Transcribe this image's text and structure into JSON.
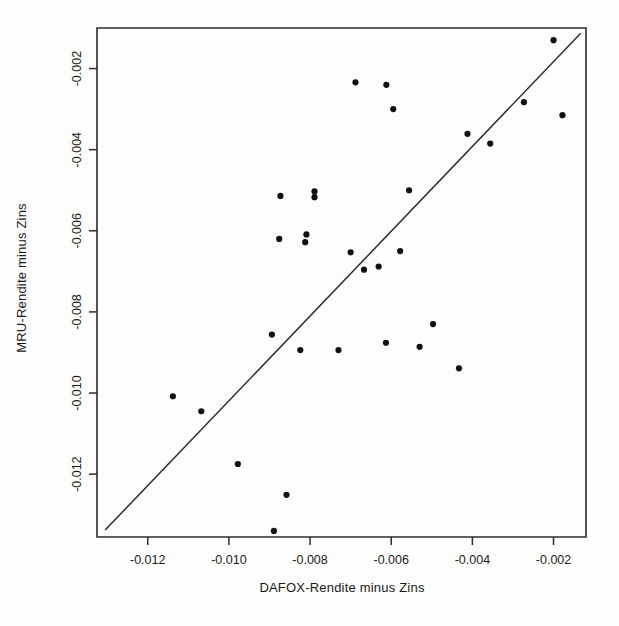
{
  "chart_data": {
    "type": "scatter",
    "title": "",
    "xlabel": "DAFOX-Rendite minus Zins",
    "ylabel": "MRU-Rendite minus Zins",
    "xlim": [
      -0.01325,
      -0.0012
    ],
    "ylim": [
      -0.01355,
      -0.001
    ],
    "grid": false,
    "legend": null,
    "xticks": [
      -0.012,
      -0.01,
      -0.008,
      -0.006,
      -0.004,
      -0.002
    ],
    "xtick_labels": [
      "-0.012",
      "-0.010",
      "-0.008",
      "-0.006",
      "-0.004",
      "-0.002"
    ],
    "yticks": [
      -0.002,
      -0.004,
      -0.006,
      -0.008,
      -0.01,
      -0.012
    ],
    "ytick_labels": [
      "-0.002",
      "-0.004",
      "-0.006",
      "-0.008",
      "-0.010",
      "-0.012"
    ],
    "point_color": "#111111",
    "point_size": 3.1,
    "reference_line": {
      "type": "identity-line",
      "x": [
        -0.01305,
        -0.00133
      ],
      "y": [
        -0.01338,
        -0.00113
      ],
      "color": "#2b2b2b"
    },
    "points": [
      {
        "x": -0.00688,
        "y": -0.00234
      },
      {
        "x": -0.00612,
        "y": -0.0024
      },
      {
        "x": -0.00595,
        "y": -0.003
      },
      {
        "x": -0.00273,
        "y": -0.00283
      },
      {
        "x": -0.00178,
        "y": -0.00315
      },
      {
        "x": -0.002,
        "y": -0.0013
      },
      {
        "x": -0.00412,
        "y": -0.00361
      },
      {
        "x": -0.00356,
        "y": -0.00385
      },
      {
        "x": -0.00873,
        "y": -0.00514
      },
      {
        "x": -0.00789,
        "y": -0.00503
      },
      {
        "x": -0.00789,
        "y": -0.00517
      },
      {
        "x": -0.00876,
        "y": -0.0062
      },
      {
        "x": -0.00809,
        "y": -0.00609
      },
      {
        "x": -0.00812,
        "y": -0.00628
      },
      {
        "x": -0.00556,
        "y": -0.005
      },
      {
        "x": -0.007,
        "y": -0.00653
      },
      {
        "x": -0.00667,
        "y": -0.00696
      },
      {
        "x": -0.00631,
        "y": -0.00688
      },
      {
        "x": -0.00578,
        "y": -0.0065
      },
      {
        "x": -0.00894,
        "y": -0.00856
      },
      {
        "x": -0.00824,
        "y": -0.00894
      },
      {
        "x": -0.0073,
        "y": -0.00894
      },
      {
        "x": -0.00613,
        "y": -0.00876
      },
      {
        "x": -0.0053,
        "y": -0.00886
      },
      {
        "x": -0.00497,
        "y": -0.0083
      },
      {
        "x": -0.00433,
        "y": -0.00939
      },
      {
        "x": -0.01138,
        "y": -0.01008
      },
      {
        "x": -0.01068,
        "y": -0.01045
      },
      {
        "x": -0.00978,
        "y": -0.01175
      },
      {
        "x": -0.00858,
        "y": -0.01251
      },
      {
        "x": -0.00889,
        "y": -0.0134
      }
    ]
  }
}
